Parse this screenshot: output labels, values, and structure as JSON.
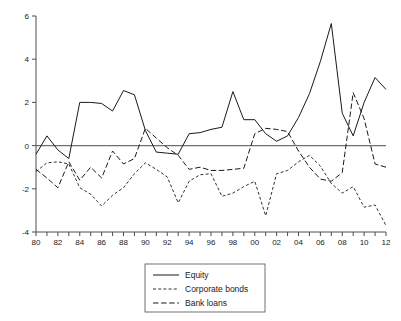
{
  "chart_data": {
    "type": "line",
    "title": "",
    "subtitle": "",
    "xlabel": "",
    "ylabel": "",
    "xlim": [
      1980,
      2012
    ],
    "ylim": [
      -4,
      6
    ],
    "yticks": [
      -4,
      -2,
      0,
      2,
      4,
      6
    ],
    "ytick_labels": [
      "-4",
      "-2",
      "0",
      "2",
      "4",
      "6"
    ],
    "xticks": [
      1980,
      1981,
      1982,
      1983,
      1984,
      1985,
      1986,
      1987,
      1988,
      1989,
      1990,
      1991,
      1992,
      1993,
      1994,
      1995,
      1996,
      1997,
      1998,
      1999,
      2000,
      2001,
      2002,
      2003,
      2004,
      2005,
      2006,
      2007,
      2008,
      2009,
      2010,
      2011,
      2012
    ],
    "xtick_labels": [
      "80",
      "",
      "82",
      "",
      "84",
      "",
      "86",
      "",
      "88",
      "",
      "90",
      "",
      "92",
      "",
      "94",
      "",
      "96",
      "",
      "98",
      "",
      "00",
      "",
      "02",
      "",
      "04",
      "",
      "06",
      "",
      "08",
      "",
      "10",
      "",
      "12"
    ],
    "grid": false,
    "zero_line": true,
    "legend_position": "bottom-center",
    "x": [
      1980,
      1981,
      1982,
      1983,
      1984,
      1985,
      1986,
      1987,
      1988,
      1989,
      1990,
      1991,
      1992,
      1993,
      1994,
      1995,
      1996,
      1997,
      1998,
      1999,
      2000,
      2001,
      2002,
      2003,
      2004,
      2005,
      2006,
      2007,
      2008,
      2009,
      2010,
      2011,
      2012
    ],
    "series": [
      {
        "name": "Equity",
        "style": "solid",
        "values": [
          -0.4,
          0.45,
          -0.2,
          -0.6,
          2.0,
          2.0,
          1.95,
          1.6,
          2.55,
          2.35,
          0.7,
          -0.3,
          -0.35,
          -0.4,
          0.55,
          0.6,
          0.75,
          0.85,
          2.5,
          1.2,
          1.2,
          0.55,
          0.2,
          0.45,
          1.3,
          2.4,
          3.9,
          5.65,
          1.5,
          0.45,
          2.0,
          3.15,
          2.6
        ]
      },
      {
        "name": "Corporate bonds",
        "style": "dotted",
        "values": [
          -1.2,
          -0.8,
          -0.75,
          -0.85,
          -1.95,
          -2.25,
          -2.8,
          -2.3,
          -1.95,
          -1.3,
          -0.8,
          -1.1,
          -1.45,
          -2.65,
          -1.65,
          -1.35,
          -1.3,
          -2.35,
          -2.2,
          -1.9,
          -1.65,
          -3.25,
          -1.3,
          -1.15,
          -0.75,
          -0.45,
          -0.95,
          -1.75,
          -2.2,
          -1.9,
          -2.85,
          -2.75,
          -3.7
        ]
      },
      {
        "name": "Bank loans",
        "style": "dashed",
        "values": [
          -1.1,
          -1.5,
          -1.95,
          -0.75,
          -1.6,
          -1.0,
          -1.5,
          -0.25,
          -0.85,
          -0.6,
          0.8,
          0.35,
          -0.1,
          -0.45,
          -1.1,
          -1.0,
          -1.15,
          -1.15,
          -1.1,
          -1.05,
          0.55,
          0.8,
          0.75,
          0.65,
          -0.25,
          -1.0,
          -1.55,
          -1.65,
          -1.25,
          2.45,
          1.25,
          -0.85,
          -1.0
        ]
      }
    ]
  },
  "legend": {
    "items": [
      {
        "label": "Equity",
        "style": "solid"
      },
      {
        "label": "Corporate bonds",
        "style": "dotted"
      },
      {
        "label": "Bank loans",
        "style": "dashed"
      }
    ]
  }
}
